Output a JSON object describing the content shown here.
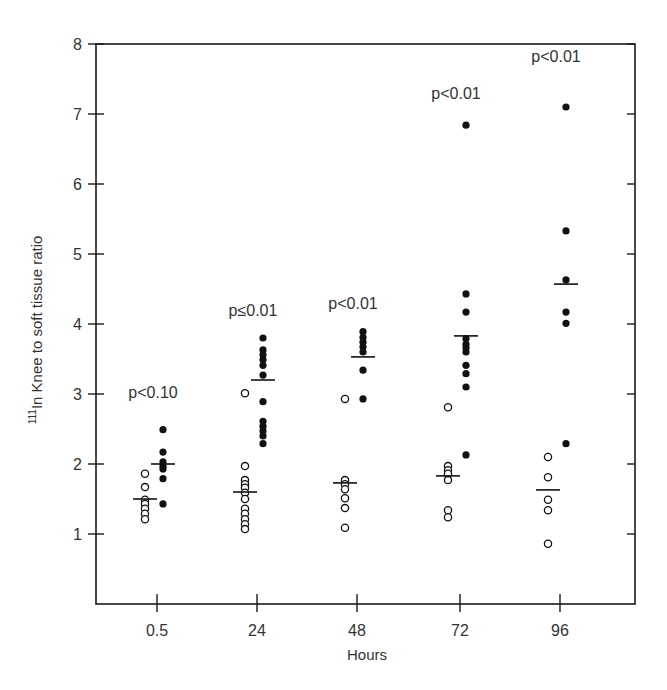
{
  "chart_data": {
    "type": "scatter",
    "title": "",
    "xlabel": "Hours",
    "ylabel_prefix": "111",
    "ylabel": "In Knee to soft tissue ratio",
    "ylim": [
      0,
      8
    ],
    "yticks": [
      1,
      2,
      3,
      4,
      5,
      6,
      7,
      8
    ],
    "categories": [
      "0.5",
      "24",
      "48",
      "72",
      "96"
    ],
    "grid": false,
    "legend": "none",
    "series": [
      {
        "name": "open (control)",
        "marker": "open-circle",
        "values": [
          [
            1.86,
            1.67,
            1.49,
            1.43,
            1.36,
            1.29,
            1.21
          ],
          [
            3.01,
            1.97,
            1.77,
            1.71,
            1.66,
            1.59,
            1.5,
            1.36,
            1.29,
            1.21,
            1.14,
            1.07
          ],
          [
            2.93,
            1.77,
            1.71,
            1.64,
            1.51,
            1.37,
            1.09
          ],
          [
            2.81,
            1.97,
            1.91,
            1.86,
            1.77,
            1.34,
            1.24
          ],
          [
            2.1,
            1.81,
            1.49,
            1.34,
            0.86
          ]
        ],
        "means": [
          1.5,
          1.6,
          1.73,
          1.83,
          1.63
        ]
      },
      {
        "name": "filled (treated)",
        "marker": "filled-circle",
        "values": [
          [
            2.49,
            2.17,
            2.03,
            1.97,
            1.93,
            1.79,
            1.43
          ],
          [
            3.8,
            3.63,
            3.56,
            3.49,
            3.41,
            3.27,
            2.89,
            2.61,
            2.54,
            2.47,
            2.4,
            2.29
          ],
          [
            3.89,
            3.81,
            3.74,
            3.67,
            3.6,
            3.34,
            2.93
          ],
          [
            6.84,
            4.43,
            4.17,
            3.79,
            3.71,
            3.66,
            3.6,
            3.41,
            3.29,
            3.1,
            2.13
          ],
          [
            7.1,
            5.33,
            4.63,
            4.17,
            4.01,
            2.29
          ]
        ],
        "means": [
          2.0,
          3.2,
          3.53,
          3.83,
          4.57
        ]
      }
    ],
    "annotations": [
      {
        "category": "0.5",
        "text": "p<0.10",
        "y": 2.95
      },
      {
        "category": "24",
        "text": "p≤0.01",
        "y": 4.12
      },
      {
        "category": "48",
        "text": "p<0.01",
        "y": 4.22
      },
      {
        "category": "72",
        "text": "p<0.01",
        "y": 7.22
      },
      {
        "category": "96",
        "text": "p<0.01",
        "y": 7.75
      }
    ]
  },
  "style": {
    "axis_color": "#1a1a1a",
    "marker_color": "#111111",
    "text_color": "#333333"
  }
}
